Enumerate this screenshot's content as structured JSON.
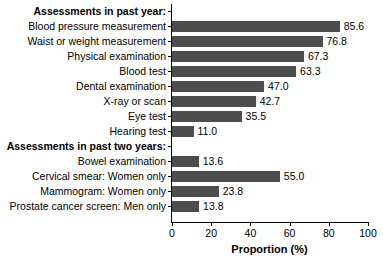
{
  "chart_data": {
    "type": "bar",
    "orientation": "horizontal",
    "title": "",
    "xlabel": "Proportion (%)",
    "ylabel": "",
    "xlim": [
      0,
      100
    ],
    "xticks": [
      0,
      20,
      40,
      60,
      80,
      100
    ],
    "xtick_labels": [
      "0",
      "20",
      "40",
      "60",
      "80",
      "100"
    ],
    "grid": false,
    "legend": null,
    "bar_color": "#4d4d4d",
    "value_label_format": "one-decimal",
    "rows": [
      {
        "label": "Assessments in past year:",
        "is_header": true,
        "value": null
      },
      {
        "label": "Blood pressure measurement",
        "is_header": false,
        "value": 85.6,
        "value_label": "85.6"
      },
      {
        "label": "Waist or weight measurement",
        "is_header": false,
        "value": 76.8,
        "value_label": "76.8"
      },
      {
        "label": "Physical examination",
        "is_header": false,
        "value": 67.3,
        "value_label": "67.3"
      },
      {
        "label": "Blood test",
        "is_header": false,
        "value": 63.3,
        "value_label": "63.3"
      },
      {
        "label": "Dental examination",
        "is_header": false,
        "value": 47.0,
        "value_label": "47.0"
      },
      {
        "label": "X-ray or scan",
        "is_header": false,
        "value": 42.7,
        "value_label": "42.7"
      },
      {
        "label": "Eye test",
        "is_header": false,
        "value": 35.5,
        "value_label": "35.5"
      },
      {
        "label": "Hearing test",
        "is_header": false,
        "value": 11.0,
        "value_label": "11.0"
      },
      {
        "label": "Assessments in past two years:",
        "is_header": true,
        "value": null
      },
      {
        "label": "Bowel examination",
        "is_header": false,
        "value": 13.6,
        "value_label": "13.6"
      },
      {
        "label": "Cervical smear: Women only",
        "is_header": false,
        "value": 55.0,
        "value_label": "55.0"
      },
      {
        "label": "Mammogram: Women only",
        "is_header": false,
        "value": 23.8,
        "value_label": "23.8"
      },
      {
        "label": "Prostate cancer screen: Men only",
        "is_header": false,
        "value": 13.8,
        "value_label": "13.8"
      }
    ],
    "categories": [
      "Blood pressure measurement",
      "Waist or weight measurement",
      "Physical examination",
      "Blood test",
      "Dental examination",
      "X-ray or scan",
      "Eye test",
      "Hearing test",
      "Bowel examination",
      "Cervical smear: Women only",
      "Mammogram: Women only",
      "Prostate cancer screen: Men only"
    ],
    "values": [
      85.6,
      76.8,
      67.3,
      63.3,
      47.0,
      42.7,
      35.5,
      11.0,
      13.6,
      55.0,
      23.8,
      13.8
    ],
    "group_headers": [
      "Assessments in past year:",
      "Assessments in past two years:"
    ]
  }
}
